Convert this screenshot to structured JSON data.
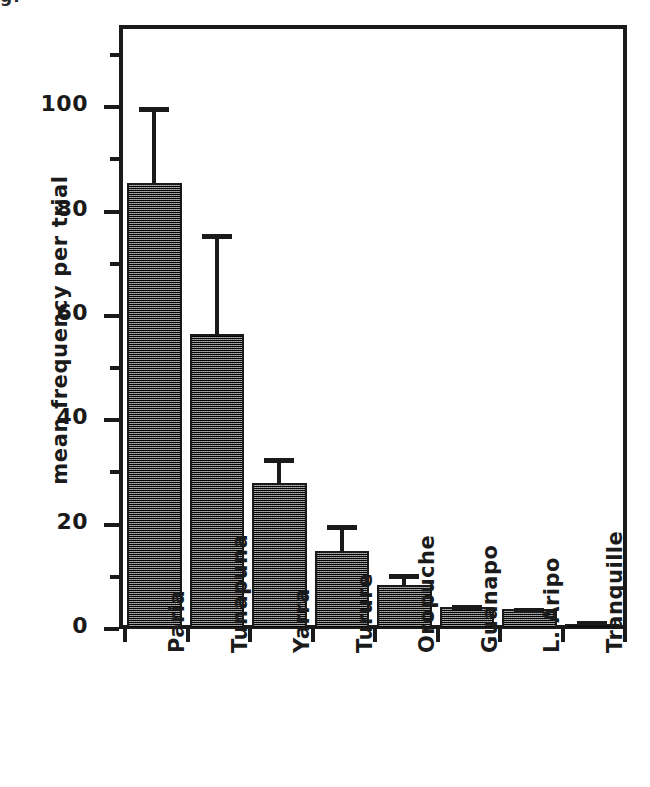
{
  "figure": {
    "clipped_caption_top": "g.",
    "ylabel": "mean frequency per trial"
  },
  "chart_data": {
    "type": "bar",
    "title": "",
    "subtitle": "",
    "xlabel": "",
    "ylabel": "mean frequency per trial",
    "ylim": [
      0,
      115
    ],
    "grid": false,
    "legend": null,
    "orientation": "vertical",
    "error_bars": "upper only (SE)",
    "xtick_rotation": -90,
    "ytick_major": [
      0,
      20,
      40,
      60,
      80,
      100
    ],
    "ytick_minor": [
      10,
      30,
      50,
      70,
      90,
      110
    ],
    "ytick_labels": [
      "0",
      "20",
      "40",
      "60",
      "80",
      "100"
    ],
    "categories": [
      "Paria",
      "Tunapuna",
      "Yarra",
      "Turure",
      "Oropuche",
      "Guanapo",
      "L. Aripo",
      "Tranquille"
    ],
    "values": [
      85.5,
      56.6,
      28.0,
      15.0,
      8.5,
      4.2,
      3.8,
      0.9
    ],
    "errors_upper": [
      14.5,
      19.1,
      4.8,
      5.0,
      2.0,
      0.4,
      0.3,
      0.6
    ],
    "upper_limits": [
      100.0,
      75.7,
      32.8,
      20.0,
      10.5,
      4.6,
      4.1,
      1.5
    ]
  }
}
